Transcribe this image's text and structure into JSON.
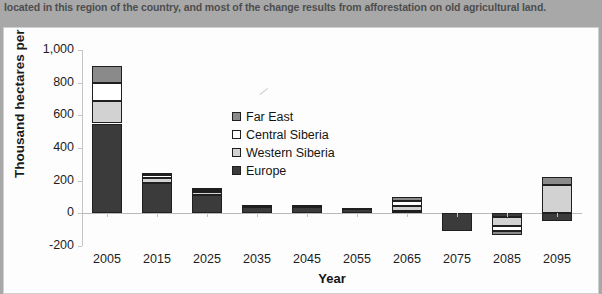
{
  "document": {
    "body_text": "located in this region of the country, and most of the change results from afforestation on old agricultural land."
  },
  "figure": {
    "legend_position": "inside-top-center"
  },
  "chart_data": {
    "type": "bar",
    "stacked": true,
    "title": "",
    "xlabel": "Year",
    "ylabel": "Thousand hectares per year",
    "categories": [
      "2005",
      "2015",
      "2025",
      "2035",
      "2045",
      "2055",
      "2065",
      "2075",
      "2085",
      "2095"
    ],
    "ylim": [
      -200,
      1000
    ],
    "yticks": [
      "-200",
      "0",
      "200",
      "400",
      "600",
      "800",
      "1,000"
    ],
    "grid": false,
    "series": [
      {
        "name": "Europe",
        "color": "#3b3b3b",
        "values": [
          550,
          185,
          110,
          42,
          40,
          25,
          12,
          -110,
          -20,
          -48
        ]
      },
      {
        "name": "Western Siberia",
        "color": "#d2d2d2",
        "values": [
          140,
          30,
          20,
          5,
          5,
          5,
          35,
          0,
          -55,
          175
        ]
      },
      {
        "name": "Central Siberia",
        "color": "#ffffff",
        "values": [
          110,
          18,
          12,
          3,
          3,
          3,
          30,
          0,
          -35,
          0
        ]
      },
      {
        "name": "Far East",
        "color": "#8a8a8a",
        "values": [
          100,
          17,
          13,
          3,
          2,
          2,
          25,
          0,
          -20,
          45
        ]
      }
    ],
    "legend_order": [
      "Far East",
      "Central Siberia",
      "Western Siberia",
      "Europe"
    ]
  }
}
